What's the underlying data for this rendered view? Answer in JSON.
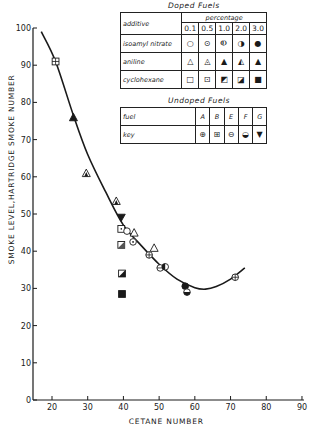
{
  "chart_data": {
    "type": "scatter",
    "title": "",
    "xlabel": "CETANE NUMBER",
    "ylabel": "SMOKE LEVEL,HARTRIDGE SMOKE NUMBER",
    "xlim": [
      15,
      90
    ],
    "ylim": [
      0,
      100
    ],
    "xticks": [
      20,
      30,
      40,
      50,
      60,
      70,
      80,
      90
    ],
    "yticks": [
      0,
      10,
      20,
      30,
      40,
      50,
      60,
      70,
      80,
      90,
      100
    ],
    "grid": false,
    "legend_position": "upper right (tables)",
    "series": [
      {
        "name": "Undoped B",
        "marker": "square-plus",
        "points": [
          [
            21,
            91
          ]
        ]
      },
      {
        "name": "aniline 3.0",
        "marker": "triangle-filled",
        "points": [
          [
            26,
            76
          ]
        ]
      },
      {
        "name": "aniline 1.0",
        "marker": "triangle-half",
        "points": [
          [
            29.6,
            61
          ],
          [
            38,
            53.5
          ]
        ]
      },
      {
        "name": "Undoped G",
        "marker": "triangle-down-filled",
        "points": [
          [
            39.4,
            49
          ]
        ]
      },
      {
        "name": "cyclohexane 0.5",
        "marker": "square-dot",
        "points": [
          [
            39.4,
            46
          ]
        ]
      },
      {
        "name": "isoamyl nitrate 0.1",
        "marker": "circle-open",
        "points": [
          [
            41,
            45.4
          ]
        ]
      },
      {
        "name": "aniline 0.1",
        "marker": "triangle-open",
        "points": [
          [
            43,
            45
          ],
          [
            48.6,
            40.9
          ]
        ]
      },
      {
        "name": "isoamyl nitrate 0.5",
        "marker": "circle-dot",
        "points": [
          [
            42.7,
            42.5
          ]
        ]
      },
      {
        "name": "cyclohexane 1.0",
        "marker": "square-slash",
        "points": [
          [
            39.4,
            41.7
          ]
        ]
      },
      {
        "name": "Undoped A",
        "marker": "circle-plus",
        "points": [
          [
            47.2,
            39
          ],
          [
            71.3,
            33
          ]
        ]
      },
      {
        "name": "Undoped E",
        "marker": "circle-minus",
        "points": [
          [
            50.3,
            35.5
          ]
        ]
      },
      {
        "name": "isoamyl nitrate 2.0",
        "marker": "circle-half",
        "points": [
          [
            51.7,
            35.8
          ]
        ]
      },
      {
        "name": "isoamyl nitrate 3.0",
        "marker": "circle-filled",
        "points": [
          [
            57.3,
            30.6
          ]
        ]
      },
      {
        "name": "Undoped F",
        "marker": "circle-bottom-filled",
        "points": [
          [
            57.8,
            29
          ]
        ]
      },
      {
        "name": "cyclohexane 2.0",
        "marker": "square-half",
        "points": [
          [
            39.6,
            34
          ]
        ]
      },
      {
        "name": "cyclohexane 3.0",
        "marker": "square-filled",
        "points": [
          [
            39.6,
            28.5
          ]
        ]
      }
    ],
    "fit_curve": {
      "name": "trend",
      "points": [
        [
          17,
          99
        ],
        [
          21,
          91
        ],
        [
          26,
          76.5
        ],
        [
          30,
          66
        ],
        [
          35,
          56
        ],
        [
          40,
          47
        ],
        [
          45,
          41.5
        ],
        [
          50,
          36.5
        ],
        [
          55,
          32.5
        ],
        [
          60,
          30.2
        ],
        [
          63,
          29.8
        ],
        [
          66,
          30.5
        ],
        [
          70,
          32.5
        ],
        [
          74,
          35.5
        ]
      ]
    }
  },
  "legend": {
    "doped": {
      "caption": "Doped    Fuels",
      "header_label": "additive",
      "group_label": "percentage",
      "columns": [
        "0.1",
        "0.5",
        "1.0",
        "2.0",
        "3.0"
      ],
      "rows": [
        {
          "label": "isoamyl nitrate",
          "symbols": [
            "○",
            "⊙",
            "⦶",
            "◑",
            "●"
          ]
        },
        {
          "label": "aniline",
          "symbols": [
            "△",
            "◬",
            "▲",
            "◭",
            "▲"
          ]
        },
        {
          "label": "cyclohexane",
          "symbols": [
            "□",
            "⊡",
            "◩",
            "◪",
            "■"
          ]
        }
      ]
    },
    "undoped": {
      "caption": "Undoped    Fuels",
      "fuel_label": "fuel",
      "key_label": "key",
      "fuels": [
        "A",
        "B",
        "E",
        "F",
        "G"
      ],
      "keys": [
        "⊕",
        "⊞",
        "⊖",
        "◒",
        "▼"
      ]
    }
  }
}
